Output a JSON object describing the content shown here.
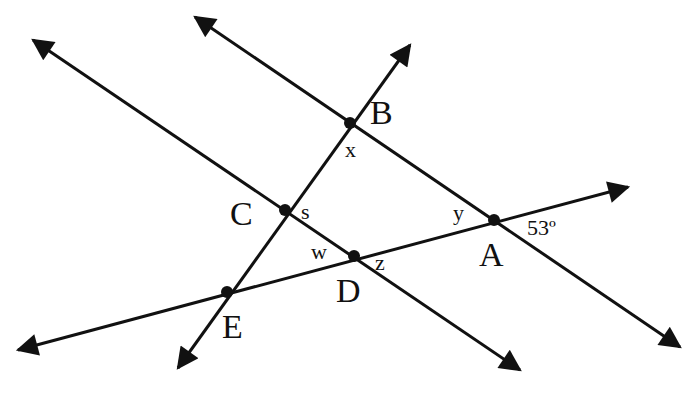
{
  "diagram": {
    "type": "geometry-parallel-lines-transversals",
    "colors": {
      "stroke": "#111111",
      "background": "#ffffff"
    },
    "points": {
      "A": {
        "label": "A",
        "x": 494,
        "y": 220
      },
      "B": {
        "label": "B",
        "x": 350,
        "y": 123
      },
      "C": {
        "label": "C",
        "x": 285,
        "y": 210
      },
      "D": {
        "label": "D",
        "x": 354,
        "y": 256
      },
      "E": {
        "label": "E",
        "x": 227,
        "y": 292
      }
    },
    "angles": {
      "x": "x",
      "y": "y",
      "s": "s",
      "w": "w",
      "z": "z",
      "given": "53º"
    },
    "lines": [
      {
        "name": "line-BA",
        "from": [
          195,
          17
        ],
        "to": [
          680,
          347
        ]
      },
      {
        "name": "line-CD",
        "from": [
          33,
          40
        ],
        "to": [
          520,
          370
        ]
      },
      {
        "name": "line-EB",
        "from": [
          178,
          368
        ],
        "to": [
          410,
          45
        ]
      },
      {
        "name": "line-EA",
        "from": [
          18,
          350
        ],
        "to": [
          628,
          187
        ]
      }
    ]
  }
}
